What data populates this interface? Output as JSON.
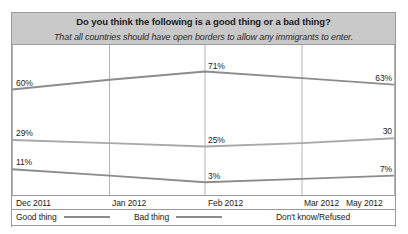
{
  "chart_data": {
    "type": "line",
    "title": "Do you think the following is a good thing or a bad thing?",
    "subtitle": "That all countries should have open borders to allow any immigrants to enter.",
    "xlabel": "",
    "ylabel": "",
    "ylim": [
      0,
      80
    ],
    "grid": "vertical",
    "legend_position": "bottom",
    "categories": [
      "Dec 2011",
      "Jan 2012",
      "Feb 2012",
      "Mar 2012",
      "May 2012"
    ],
    "series": [
      {
        "name": "Good thing",
        "color": "#8c8c8c",
        "values": [
          11,
          7,
          3,
          5,
          7
        ],
        "labels": [
          "11%",
          "",
          "3%",
          "",
          "7%"
        ]
      },
      {
        "name": "Bad thing",
        "color": "#8c8c8c",
        "values": [
          60,
          66,
          71,
          67,
          63
        ],
        "labels": [
          "60%",
          "",
          "71%",
          "",
          "63%"
        ]
      },
      {
        "name": "Don't know/Refused",
        "color": "#a8a8a8",
        "values": [
          29,
          27,
          25,
          27,
          30
        ],
        "labels": [
          "29%",
          "",
          "25%",
          "",
          "30"
        ]
      }
    ]
  },
  "axis": {
    "ticks": [
      {
        "label": "Dec 2011",
        "x": 4
      },
      {
        "label": "Jan 2012",
        "x": 100
      },
      {
        "label": "Feb 2012",
        "x": 196
      },
      {
        "label": "Mar 2012",
        "x": 292
      },
      {
        "label": "May 2012",
        "x": 334
      }
    ]
  },
  "legend": {
    "entries": [
      {
        "label": "Good thing",
        "x": 4,
        "swatch": true,
        "color": "#8c8c8c"
      },
      {
        "label": "Bad thing",
        "x": 122,
        "swatch": true,
        "color": "#8c8c8c"
      },
      {
        "label": "Don't know/Refused",
        "x": 264,
        "swatch": false,
        "color": "#a8a8a8"
      }
    ]
  },
  "style": {
    "header_band_color": "#c9c9c9",
    "frame_border_color": "#9a9a9a",
    "gridline_color": "#b4b4b4",
    "line_color_primary": "#8c8c8c",
    "line_color_secondary": "#a8a8a8",
    "text_color": "#1b1b1b"
  }
}
